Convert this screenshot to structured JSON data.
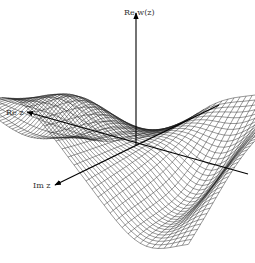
{
  "figure": {
    "axes": {
      "vertical": {
        "label": "Re w(z)"
      },
      "re_z": {
        "label": "Re z"
      },
      "im_z": {
        "label": "Im z"
      }
    },
    "colors": {
      "mesh": "#1a1a1a",
      "axis": "#000000",
      "background": "#ffffff",
      "label": "#333333"
    }
  }
}
